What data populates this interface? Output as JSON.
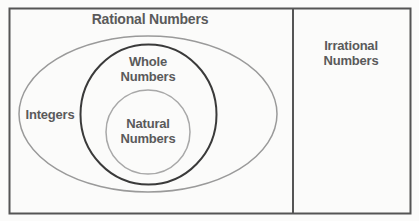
{
  "diagram": {
    "type": "venn-number-sets",
    "colors": {
      "background": "#fbfbfa",
      "box_border": "#555555",
      "rational_ellipse": "#9a9a9a",
      "whole_ellipse": "#3a3a3a",
      "natural_circle": "#a8a8a8",
      "text": "#5a5a5a"
    },
    "regions": {
      "rational": {
        "label": "Rational Numbers"
      },
      "integers": {
        "label": "Integers"
      },
      "whole": {
        "label_line1": "Whole",
        "label_line2": "Numbers"
      },
      "natural": {
        "label_line1": "Natural",
        "label_line2": "Numbers"
      },
      "irrational": {
        "label_line1": "Irrational",
        "label_line2": "Numbers"
      }
    }
  }
}
